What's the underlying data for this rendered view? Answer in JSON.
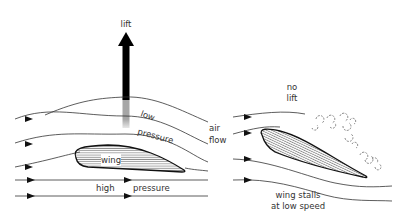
{
  "left_diagram": {
    "lift_label": "lift",
    "low_label": "low",
    "pressure_top_label": "pressure",
    "wing_label": "wing",
    "high_label": "high",
    "pressure_bottom_label": "pressure"
  },
  "middle_label": {
    "line1": "air",
    "line2": "flow"
  },
  "right_diagram": {
    "no_label": "no",
    "lift_label": "lift",
    "caption_line1": "wing stalls",
    "caption_line2": "at low speed"
  }
}
